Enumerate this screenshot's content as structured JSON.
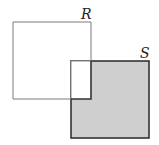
{
  "diagram": {
    "shapes": [
      {
        "id": "R",
        "label": "R",
        "x": 13,
        "y": 22,
        "width": 78,
        "height": 77,
        "fill": "#ffffff",
        "stroke": "#7a7a7a"
      },
      {
        "id": "S",
        "label": "S",
        "x": 71,
        "y": 61,
        "width": 78,
        "height": 77,
        "fill": "#cfcfcf",
        "stroke": "#333333"
      }
    ],
    "overlap_fill": "#ffffff",
    "labels": {
      "r": "R",
      "s": "S"
    }
  }
}
